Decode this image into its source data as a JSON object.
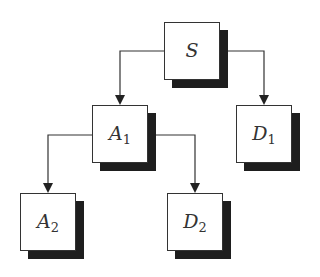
{
  "diagram": {
    "type": "tree",
    "nodes": [
      {
        "id": "S",
        "label": "S",
        "subscript": ""
      },
      {
        "id": "A1",
        "label": "A",
        "subscript": "1"
      },
      {
        "id": "D1",
        "label": "D",
        "subscript": "1"
      },
      {
        "id": "A2",
        "label": "A",
        "subscript": "2"
      },
      {
        "id": "D2",
        "label": "D",
        "subscript": "2"
      }
    ],
    "edges": [
      {
        "from": "S",
        "to": "A1"
      },
      {
        "from": "S",
        "to": "D1"
      },
      {
        "from": "A1",
        "to": "A2"
      },
      {
        "from": "A1",
        "to": "D2"
      }
    ]
  }
}
